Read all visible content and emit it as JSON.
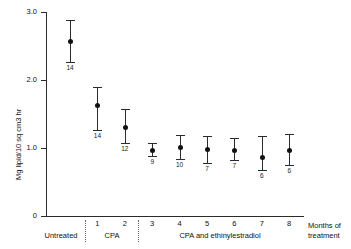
{
  "chart_data": {
    "type": "scatter",
    "title": "",
    "xlabel": "Months of treatment",
    "ylabel": "Mg lipid/10 sq cm3 hr",
    "ylim": [
      0,
      3.0
    ],
    "ytick_labels": [
      "0",
      "1.0",
      "2.0",
      "3.0"
    ],
    "ytick_values": [
      0,
      1.0,
      2.0,
      3.0
    ],
    "xtick_labels": [
      "1",
      "2",
      "3",
      "4",
      "5",
      "6",
      "7",
      "8"
    ],
    "grid": false,
    "legend": false,
    "error_bar_style": "mean with symmetric range bars and caps",
    "group_labels": [
      {
        "label": "Untreated",
        "span": "pre-treatment baseline"
      },
      {
        "label": "CPA",
        "span": "months 1-2"
      },
      {
        "label": "CPA and ethinylestradiol",
        "span": "months 3-8"
      }
    ],
    "points": [
      {
        "category": "Untreated",
        "x_index": 0,
        "value": 2.57,
        "err_low": 2.26,
        "err_high": 2.88,
        "n": "14"
      },
      {
        "category": "1",
        "x_index": 1,
        "value": 1.63,
        "err_low": 1.26,
        "err_high": 1.9,
        "n": "14"
      },
      {
        "category": "2",
        "x_index": 2,
        "value": 1.31,
        "err_low": 1.07,
        "err_high": 1.57,
        "n": "12"
      },
      {
        "category": "3",
        "x_index": 3,
        "value": 0.97,
        "err_low": 0.88,
        "err_high": 1.07,
        "n": "9"
      },
      {
        "category": "4",
        "x_index": 4,
        "value": 1.01,
        "err_low": 0.84,
        "err_high": 1.19,
        "n": "10"
      },
      {
        "category": "5",
        "x_index": 5,
        "value": 0.98,
        "err_low": 0.78,
        "err_high": 1.18,
        "n": "7"
      },
      {
        "category": "6",
        "x_index": 6,
        "value": 0.97,
        "err_low": 0.82,
        "err_high": 1.15,
        "n": "7"
      },
      {
        "category": "7",
        "x_index": 7,
        "value": 0.87,
        "err_low": 0.68,
        "err_high": 1.18,
        "n": "6"
      },
      {
        "category": "8",
        "x_index": 8,
        "value": 0.97,
        "err_low": 0.75,
        "err_high": 1.2,
        "n": "6"
      }
    ],
    "axis_title_x_lines": [
      "Months of",
      "treatment"
    ],
    "colors": {
      "marker": "#111111",
      "axis": "#2b2b2b",
      "divider": "#6a6a6a"
    }
  }
}
